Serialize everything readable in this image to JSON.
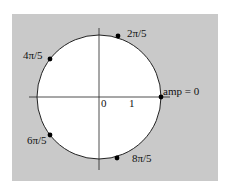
{
  "colors": {
    "background": "#ffffff",
    "panel": "#c9c9c9",
    "disk": "#ffffff",
    "ink": "#111111"
  },
  "diagram": {
    "origin_label": "0",
    "unit_label": "1",
    "points": [
      {
        "label": "amp = 0",
        "angle": "0"
      },
      {
        "label": "2π/5",
        "angle": "2π/5"
      },
      {
        "label": "4π/5",
        "angle": "4π/5"
      },
      {
        "label": "6π/5",
        "angle": "6π/5"
      },
      {
        "label": "8π/5",
        "angle": "8π/5"
      }
    ]
  }
}
